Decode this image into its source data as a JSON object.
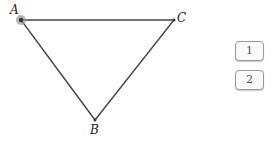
{
  "diagram": {
    "points": [
      {
        "label": "A",
        "x": 21,
        "y": 20
      },
      {
        "label": "C",
        "x": 174,
        "y": 20
      },
      {
        "label": "B",
        "x": 95,
        "y": 120
      }
    ],
    "selected_point": "A",
    "line_color": "#444444",
    "highlight_color": "#888888"
  },
  "buttons": [
    {
      "label": "1"
    },
    {
      "label": "2"
    }
  ]
}
